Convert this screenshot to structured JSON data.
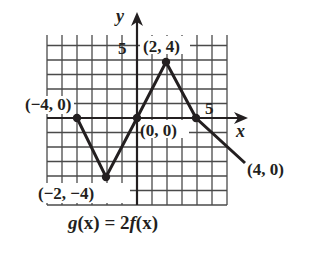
{
  "chart_data": {
    "type": "line",
    "title": "g(x) = 2f(x)",
    "xlabel": "x",
    "ylabel": "y",
    "xlim": [
      -6,
      6
    ],
    "ylim": [
      -6,
      6
    ],
    "grid": true,
    "x_tick_labels": [
      {
        "value": 5,
        "label": "5"
      }
    ],
    "y_tick_labels": [
      {
        "value": 5,
        "label": "5"
      }
    ],
    "series": [
      {
        "name": "g(x)",
        "points": [
          {
            "x": -4,
            "y": 0,
            "label": "(−4, 0)"
          },
          {
            "x": -2,
            "y": -4,
            "label": "(−2, −4)"
          },
          {
            "x": 0,
            "y": 0,
            "label": "(0, 0)"
          },
          {
            "x": 2,
            "y": 4,
            "label": "(2, 4)"
          },
          {
            "x": 4,
            "y": 0,
            "label": "(4, 0)"
          },
          {
            "x": 5,
            "y": -2.5
          }
        ]
      }
    ],
    "annotations": [
      "(−4, 0)",
      "(−2, −4)",
      "(0, 0)",
      "(2, 4)",
      "(4, 0)"
    ]
  },
  "labels": {
    "y_axis": "y",
    "x_axis": "x",
    "y_tick_5": "5",
    "x_tick_5": "5",
    "pt_m4_0": "(−4, 0)",
    "pt_m2_m4": "(−2, −4)",
    "pt_0_0": "(0, 0)",
    "pt_2_4": "(2, 4)",
    "pt_4_0": "(4, 0)",
    "formula_g": "g",
    "formula_mid": "(x) = 2",
    "formula_f": "f",
    "formula_end": "(x)"
  },
  "colors": {
    "ink": "#231f20",
    "grid": "#4a4a4a",
    "background": "#ffffff"
  }
}
